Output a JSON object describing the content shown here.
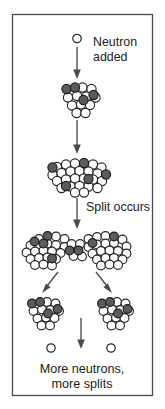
{
  "figure": {
    "background_color": "#ffffff",
    "frame": {
      "stroke_color": "#4a4a52",
      "x": 12,
      "y": 14,
      "width": 140,
      "height": 381
    },
    "colors": {
      "nucleon_light_fill": "#ffffff",
      "nucleon_dark_fill": "#5b5b5f",
      "outline": "#26262a",
      "arrow": "#4a4a50",
      "text": "#1c1c20"
    }
  },
  "labels": {
    "neutron_added_line1": "Neutron",
    "neutron_added_line2": "added",
    "split_occurs": "Split occurs",
    "caption_line1": "More neutrons,",
    "caption_line2": "more splits"
  },
  "stages": [
    {
      "name": "incoming-neutron",
      "kind": "free-neutron",
      "description": "A single free neutron approaches the nucleus",
      "neutron_count": 1
    },
    {
      "name": "nucleus-absorbing",
      "kind": "nucleus",
      "description": "Compact nucleus after absorbing the neutron",
      "nucleon_count": 15,
      "dark_nucleon_count": 3
    },
    {
      "name": "nucleus-excited",
      "kind": "nucleus",
      "description": "Excited, elongated nucleus before splitting",
      "nucleon_count": 29,
      "dark_nucleon_count": 5
    },
    {
      "name": "nucleus-splitting",
      "kind": "nucleus",
      "description": "Nucleus necking into two fragments (dumbbell shape)",
      "nucleon_count": 50,
      "dark_nucleon_count": 8
    },
    {
      "name": "fragment-left",
      "kind": "nucleus",
      "description": "Left daughter fragment",
      "nucleon_count": 15,
      "dark_nucleon_count": 3
    },
    {
      "name": "fragment-right",
      "kind": "nucleus",
      "description": "Right daughter fragment",
      "nucleon_count": 15,
      "dark_nucleon_count": 3
    },
    {
      "name": "released-neutrons",
      "kind": "free-neutron",
      "description": "Neutrons released by the fission event",
      "neutron_count": 2
    }
  ],
  "arrows": [
    {
      "name": "arrow-neutron-to-nucleus",
      "direction": "down"
    },
    {
      "name": "arrow-nucleus-to-excited",
      "direction": "down"
    },
    {
      "name": "arrow-split",
      "direction": "down",
      "label": "Split occurs"
    },
    {
      "name": "arrow-to-left-fragment",
      "direction": "down-left"
    },
    {
      "name": "arrow-to-right-fragment",
      "direction": "down-right"
    },
    {
      "name": "arrow-neutron-release",
      "direction": "down"
    }
  ]
}
